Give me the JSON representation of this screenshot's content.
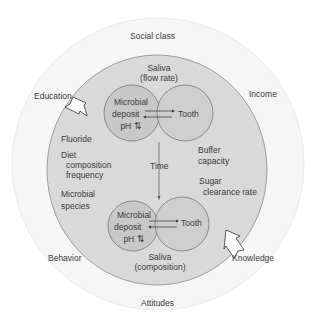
{
  "outer_ring": {
    "labels": {
      "top": "Social class",
      "left": "Education",
      "right": "Income",
      "bottom_left": "Behavior",
      "bottom_right": "Knowledge",
      "bottom": "Attitudes"
    }
  },
  "inner_circle": {
    "saliva_top": [
      "Saliva",
      "(flow rate)"
    ],
    "saliva_bottom": [
      "Saliva",
      "(composition)"
    ],
    "left_factors": [
      "Fluoride",
      "Diet",
      "composition",
      "frequency",
      "Microbial",
      "species"
    ],
    "right_factors": [
      "Buffer",
      "capacity",
      "Sugar",
      "clearance rate"
    ],
    "time_label": "Time"
  },
  "venn_top": {
    "left": [
      "Microbial",
      "deposit",
      "pH ⇅"
    ],
    "right": "Tooth"
  },
  "venn_bottom": {
    "left": [
      "Microbial",
      "deposit",
      "pH ⇅"
    ],
    "right": "Tooth"
  },
  "colors": {
    "outer_fill": "#f6f6f6",
    "inner_fill": "#d9d9d9",
    "venn_fill": "#c8c8c8",
    "stroke": "#777777"
  }
}
